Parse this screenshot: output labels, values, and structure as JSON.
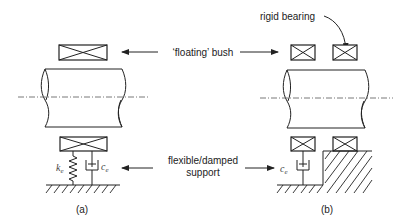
{
  "labels": {
    "floating_bush": "‘floating’ bush",
    "rigid_bearing": "rigid bearing",
    "flexible_line1": "flexible/damped",
    "flexible_line2": "support",
    "spring_symbol": "k",
    "spring_subscript": "e",
    "damper_symbol": "c",
    "damper_subscript": "e",
    "panel_a": "(a)",
    "panel_b": "(b)"
  }
}
